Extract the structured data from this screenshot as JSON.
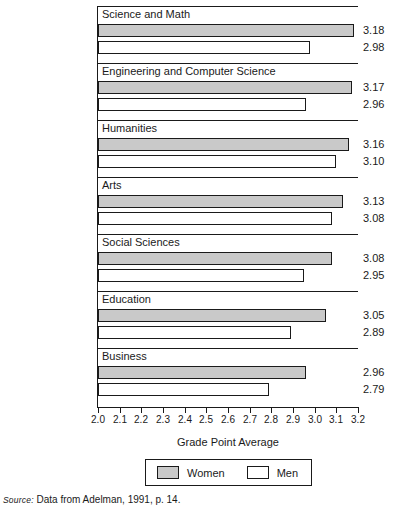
{
  "figure": {
    "cropped_title_sliver": "GRADE POINT AVERAGE BY FIELD",
    "axis_title": "Grade Point Average",
    "source_prefix": "Source:",
    "source_text": " Data from Adelman, 1991, p. 14."
  },
  "legend": {
    "items": [
      {
        "label": "Women",
        "color": "#c9c9c9",
        "swatch": "filled-gray-swatch"
      },
      {
        "label": "Men",
        "color": "#ffffff",
        "swatch": "empty-white-swatch"
      }
    ]
  },
  "chart_data": {
    "type": "bar",
    "orientation": "horizontal",
    "title": "",
    "xlabel": "Grade Point Average",
    "ylabel": "",
    "xlim": [
      2.0,
      3.2
    ],
    "xticks": [
      "2.0",
      "2.1",
      "2.2",
      "2.3",
      "2.4",
      "2.5",
      "2.6",
      "2.7",
      "2.8",
      "2.9",
      "3.0",
      "3.1",
      "3.2"
    ],
    "grid": false,
    "legend_position": "bottom",
    "categories": [
      "Science and Math",
      "Engineering and Computer Science",
      "Humanities",
      "Arts",
      "Social Sciences",
      "Education",
      "Business"
    ],
    "series": [
      {
        "name": "Women",
        "color": "#c9c9c9",
        "values": [
          3.18,
          3.17,
          3.16,
          3.13,
          3.08,
          3.05,
          2.96
        ],
        "labels": [
          "3.18",
          "3.17",
          "3.16",
          "3.13",
          "3.08",
          "3.05",
          "2.96"
        ]
      },
      {
        "name": "Men",
        "color": "#ffffff",
        "values": [
          2.98,
          2.96,
          3.1,
          3.08,
          2.95,
          2.89,
          2.79
        ],
        "labels": [
          "2.98",
          "2.96",
          "3.10",
          "3.08",
          "2.95",
          "2.89",
          "2.79"
        ]
      }
    ]
  }
}
